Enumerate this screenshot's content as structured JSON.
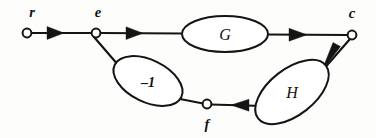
{
  "diagram": {
    "type": "signal-flow-graph",
    "background_color": "#fdfdfc",
    "line_color": "#141414",
    "nodes": [
      {
        "id": "r",
        "label": "r",
        "cx": 27,
        "cy": 33,
        "r": 4.4,
        "label_x": 32,
        "label_y": 17
      },
      {
        "id": "e",
        "label": "e",
        "cx": 96,
        "cy": 33,
        "r": 4.4,
        "label_x": 98,
        "label_y": 17
      },
      {
        "id": "c",
        "label": "c",
        "cx": 352,
        "cy": 35,
        "r": 4.4,
        "label_x": 352,
        "label_y": 18
      },
      {
        "id": "f",
        "label": "f",
        "cx": 207,
        "cy": 104,
        "r": 4.4,
        "label_x": 207,
        "label_y": 129
      }
    ],
    "blocks": [
      {
        "id": "G",
        "label": "G",
        "cx": 225,
        "cy": 34,
        "rx": 43,
        "ry": 18,
        "rotation": 0,
        "label_x": 225,
        "label_y": 40
      },
      {
        "id": "H",
        "label": "H",
        "cx": 292,
        "cy": 92,
        "rx": 43,
        "ry": 23,
        "rotation": -38,
        "label_x": 292,
        "label_y": 98
      },
      {
        "id": "neg1",
        "label": "–1",
        "cx": 148,
        "cy": 81,
        "rx": 37,
        "ry": 21,
        "rotation": 26,
        "label_x": 148,
        "label_y": 87
      }
    ],
    "edges": [
      {
        "id": "r-to-e",
        "from": "r",
        "to": "e",
        "label": ""
      },
      {
        "id": "e-to-G",
        "from": "e",
        "to": "G",
        "label": ""
      },
      {
        "id": "G-to-c",
        "from": "G",
        "to": "c",
        "label": ""
      },
      {
        "id": "c-to-H",
        "from": "c",
        "to": "H",
        "label": ""
      },
      {
        "id": "H-to-f",
        "from": "H",
        "to": "f",
        "label": ""
      },
      {
        "id": "f-to-neg1",
        "from": "f",
        "to": "neg1",
        "label": ""
      },
      {
        "id": "neg1-to-e",
        "from": "neg1",
        "to": "e",
        "label": ""
      }
    ]
  }
}
